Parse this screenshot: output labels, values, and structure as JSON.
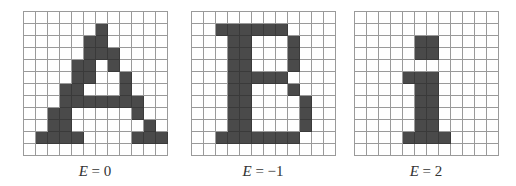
{
  "figure": {
    "panels": [
      {
        "letter": "A",
        "label_var": "E",
        "label_eq": " = 0",
        "rows": 12,
        "cols": 12,
        "filled": [
          [
            1,
            6
          ],
          [
            2,
            5
          ],
          [
            2,
            6
          ],
          [
            3,
            5
          ],
          [
            3,
            6
          ],
          [
            3,
            7
          ],
          [
            4,
            4
          ],
          [
            4,
            5
          ],
          [
            4,
            7
          ],
          [
            5,
            4
          ],
          [
            5,
            5
          ],
          [
            5,
            8
          ],
          [
            6,
            3
          ],
          [
            6,
            4
          ],
          [
            6,
            8
          ],
          [
            7,
            3
          ],
          [
            7,
            4
          ],
          [
            7,
            5
          ],
          [
            7,
            6
          ],
          [
            7,
            7
          ],
          [
            7,
            8
          ],
          [
            7,
            9
          ],
          [
            8,
            2
          ],
          [
            8,
            3
          ],
          [
            8,
            9
          ],
          [
            9,
            2
          ],
          [
            9,
            3
          ],
          [
            9,
            10
          ],
          [
            10,
            1
          ],
          [
            10,
            2
          ],
          [
            10,
            3
          ],
          [
            10,
            4
          ],
          [
            10,
            9
          ],
          [
            10,
            10
          ],
          [
            10,
            11
          ]
        ]
      },
      {
        "letter": "B",
        "label_var": "E",
        "label_eq": " = −1",
        "rows": 12,
        "cols": 12,
        "filled": [
          [
            1,
            2
          ],
          [
            1,
            3
          ],
          [
            1,
            4
          ],
          [
            1,
            5
          ],
          [
            1,
            6
          ],
          [
            1,
            7
          ],
          [
            2,
            3
          ],
          [
            2,
            4
          ],
          [
            2,
            8
          ],
          [
            3,
            3
          ],
          [
            3,
            4
          ],
          [
            3,
            8
          ],
          [
            4,
            3
          ],
          [
            4,
            4
          ],
          [
            4,
            8
          ],
          [
            5,
            3
          ],
          [
            5,
            4
          ],
          [
            5,
            5
          ],
          [
            5,
            6
          ],
          [
            5,
            7
          ],
          [
            6,
            3
          ],
          [
            6,
            4
          ],
          [
            6,
            8
          ],
          [
            7,
            3
          ],
          [
            7,
            4
          ],
          [
            7,
            9
          ],
          [
            8,
            3
          ],
          [
            8,
            4
          ],
          [
            8,
            9
          ],
          [
            9,
            3
          ],
          [
            9,
            4
          ],
          [
            9,
            9
          ],
          [
            10,
            2
          ],
          [
            10,
            3
          ],
          [
            10,
            4
          ],
          [
            10,
            5
          ],
          [
            10,
            6
          ],
          [
            10,
            7
          ],
          [
            10,
            8
          ]
        ]
      },
      {
        "letter": "i",
        "label_var": "E",
        "label_eq": " = 2",
        "rows": 12,
        "cols": 12,
        "filled": [
          [
            2,
            5
          ],
          [
            2,
            6
          ],
          [
            3,
            5
          ],
          [
            3,
            6
          ],
          [
            5,
            4
          ],
          [
            5,
            5
          ],
          [
            5,
            6
          ],
          [
            6,
            5
          ],
          [
            6,
            6
          ],
          [
            7,
            5
          ],
          [
            7,
            6
          ],
          [
            8,
            5
          ],
          [
            8,
            6
          ],
          [
            9,
            5
          ],
          [
            9,
            6
          ],
          [
            10,
            4
          ],
          [
            10,
            5
          ],
          [
            10,
            6
          ],
          [
            10,
            7
          ]
        ]
      }
    ],
    "colors": {
      "filled": "#4a4a4a",
      "grid_line": "#9a9a9a"
    }
  }
}
